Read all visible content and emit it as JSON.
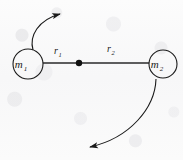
{
  "figure": {
    "background_color": "#fafafa",
    "stroke_color": "#1a1a1a",
    "bodies": [
      {
        "id": "body-1",
        "label_main": "m",
        "label_sub": "1",
        "cx": 28,
        "cy": 64,
        "r": 15
      },
      {
        "id": "body-2",
        "label_main": "m",
        "label_sub": "2",
        "cx": 163,
        "cy": 64,
        "r": 14
      }
    ],
    "barycenter": {
      "label": "center-of-mass",
      "cx": 79,
      "cy": 63,
      "r": 3.2
    },
    "distances": [
      {
        "id": "r1",
        "main": "r",
        "sub": "1",
        "x": 54,
        "y": 54,
        "from": "body-1",
        "to": "barycenter"
      },
      {
        "id": "r2",
        "main": "r",
        "sub": "2",
        "x": 107,
        "y": 52,
        "from": "barycenter",
        "to": "body-2"
      }
    ],
    "connector": {
      "x1": 43,
      "y1": 63,
      "x2": 149,
      "y2": 63
    },
    "arrows": [
      {
        "id": "orbit-arrow-top",
        "description": "curved motion arrow for m1, sweeping up and to the right",
        "path": "M 33 50 C 29 36, 38 20, 60 14",
        "tip_x": 72,
        "tip_y": 13
      },
      {
        "id": "orbit-arrow-bottom",
        "description": "curved motion arrow for m2, sweeping down and to the left",
        "path": "M 156 79 C 155 108, 130 138, 90 147",
        "tip_x": 76,
        "tip_y": 148
      }
    ]
  }
}
